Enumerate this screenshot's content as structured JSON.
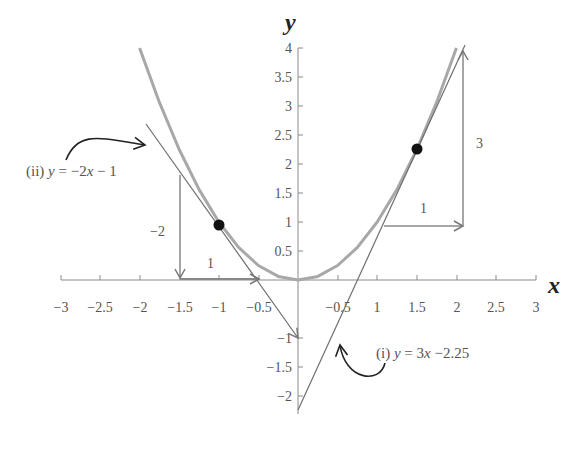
{
  "chart_data": {
    "type": "line",
    "title": "",
    "xlabel": "x",
    "ylabel": "y",
    "xlim": [
      -3,
      3
    ],
    "ylim": [
      -2.25,
      4
    ],
    "grid": false,
    "x_ticks": [
      "−3",
      "−2.5",
      "−2",
      "−1.5",
      "−1",
      "−0.5",
      "−0.5",
      "1",
      "1.5",
      "2",
      "2.5",
      "3"
    ],
    "y_ticks": [
      "4",
      "3.5",
      "3",
      "2.5",
      "2",
      "1.5",
      "1",
      "0.5",
      "−1",
      "−1.5",
      "−2"
    ],
    "series": [
      {
        "name": "y = x^2",
        "color": "#a0a0a0",
        "x": [
          -2,
          -1.75,
          -1.5,
          -1.25,
          -1,
          -0.75,
          -0.5,
          -0.25,
          0,
          0.25,
          0.5,
          0.75,
          1,
          1.25,
          1.5,
          1.75,
          2
        ],
        "y": [
          4,
          3.0625,
          2.25,
          1.5625,
          1,
          0.5625,
          0.25,
          0.0625,
          0,
          0.0625,
          0.25,
          0.5625,
          1,
          1.5625,
          2.25,
          3.0625,
          4
        ]
      },
      {
        "name": "(i) y = 3x −2.25",
        "color": "#707070",
        "x": [
          0,
          2.1
        ],
        "y": [
          -2.25,
          4.05
        ]
      },
      {
        "name": "(ii) y = −2x − 1",
        "color": "#707070",
        "x": [
          -1.85,
          0
        ],
        "y": [
          2.7,
          -1
        ]
      }
    ],
    "points": [
      {
        "x": -1,
        "y": 1,
        "label": "tangent point (ii)"
      },
      {
        "x": 1.5,
        "y": 2.25,
        "label": "tangent point (i)"
      }
    ],
    "annotations": [
      {
        "text": "(ii) y = −2x − 1",
        "near": [
          -2.4,
          2.1
        ]
      },
      {
        "text": "(i) y = 3x −2.25",
        "near": [
          0.7,
          -1.2
        ]
      },
      {
        "text": "−2",
        "role": "rise of tangent (ii)"
      },
      {
        "text": "1",
        "role": "run of tangent (ii)"
      },
      {
        "text": "3",
        "role": "rise of tangent (i)"
      },
      {
        "text": "1",
        "role": "run of tangent (i)"
      }
    ]
  },
  "labels": {
    "x_axis": "x",
    "y_axis": "y",
    "eq_ii_prefix": "(ii) ",
    "eq_ii_y": "y",
    "eq_ii_rest": " = −2",
    "eq_ii_x": "x",
    "eq_ii_tail": " − 1",
    "eq_i_prefix": "(i) ",
    "eq_i_y": "y",
    "eq_i_rest": " = 3",
    "eq_i_x": "x",
    "eq_i_tail": " −2.25",
    "rise_ii": "−2",
    "run_ii": "1",
    "rise_i": "3",
    "run_i": "1"
  },
  "ticks": {
    "x": [
      {
        "label": "−3",
        "px": 61
      },
      {
        "label": "−2.5",
        "px": 100
      },
      {
        "label": "−2",
        "px": 140
      },
      {
        "label": "−1.5",
        "px": 180
      },
      {
        "label": "−1",
        "px": 219
      },
      {
        "label": "−0.5",
        "px": 259
      },
      {
        "label": "−0.5",
        "px": 338
      },
      {
        "label": "1",
        "px": 377
      },
      {
        "label": "1.5",
        "px": 417
      },
      {
        "label": "2",
        "px": 457
      },
      {
        "label": "2.5",
        "px": 496
      },
      {
        "label": "3",
        "px": 536
      }
    ],
    "y": [
      {
        "label": "4",
        "py": 48
      },
      {
        "label": "3.5",
        "py": 77
      },
      {
        "label": "3",
        "py": 106
      },
      {
        "label": "2.5",
        "py": 135
      },
      {
        "label": "2",
        "py": 164
      },
      {
        "label": "1.5",
        "py": 193
      },
      {
        "label": "1",
        "py": 222
      },
      {
        "label": "0.5",
        "py": 251
      },
      {
        "label": "−1",
        "py": 338
      },
      {
        "label": "−1.5",
        "py": 367
      },
      {
        "label": "−2",
        "py": 396
      }
    ]
  }
}
